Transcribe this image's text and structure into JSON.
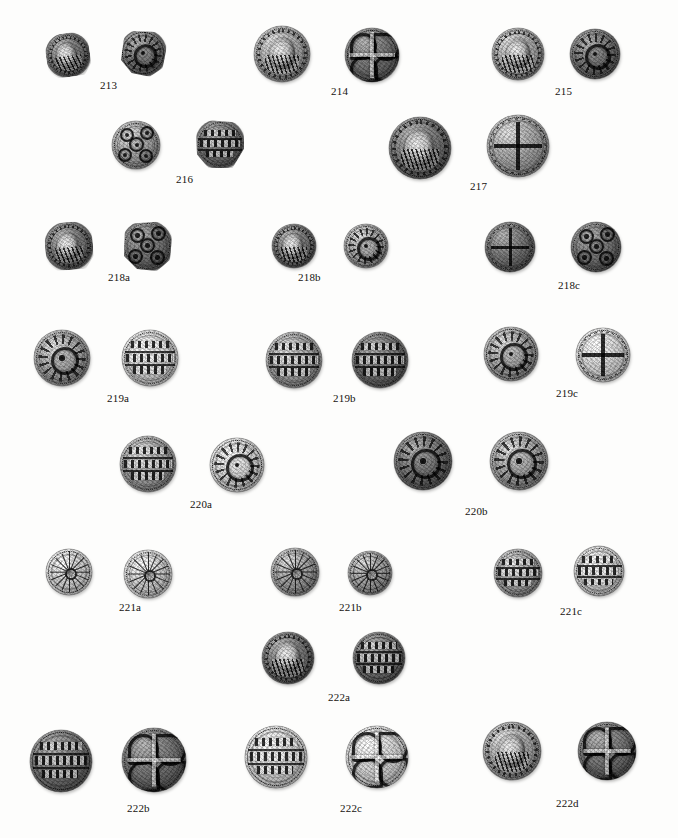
{
  "plate": {
    "background_color": "#fdfdfc",
    "caption_color": "#15130f",
    "description": "Photographic plate of Anglo-Saxon silver pennies shown as obverse and reverse pairs with catalogue numbers"
  },
  "entries": [
    {
      "id": "213",
      "label": "213",
      "label_x": 100,
      "label_y": 80,
      "coins": [
        {
          "x": 46,
          "y": 33,
          "size": 44,
          "design": "bust",
          "tone": "dark",
          "clip": "clip-a",
          "rotate": -8,
          "name": "coin-213-obverse"
        },
        {
          "x": 120,
          "y": 30,
          "size": 46,
          "design": "rosette",
          "tone": "dark",
          "clip": "clip-b",
          "rotate": 6,
          "name": "coin-213-reverse"
        }
      ]
    },
    {
      "id": "214",
      "label": "214",
      "label_x": 331,
      "label_y": 86,
      "coins": [
        {
          "x": 254,
          "y": 26,
          "size": 56,
          "design": "bust",
          "tone": "mid",
          "clip": "",
          "rotate": 0,
          "name": "coin-214-obverse"
        },
        {
          "x": 345,
          "y": 28,
          "size": 54,
          "design": "knot",
          "tone": "dark",
          "clip": "",
          "rotate": 0,
          "name": "coin-214-reverse"
        }
      ]
    },
    {
      "id": "215",
      "label": "215",
      "label_x": 555,
      "label_y": 86,
      "coins": [
        {
          "x": 492,
          "y": 28,
          "size": 52,
          "design": "bust",
          "tone": "mid",
          "clip": "",
          "rotate": 0,
          "name": "coin-215-obverse"
        },
        {
          "x": 570,
          "y": 29,
          "size": 50,
          "design": "rosette",
          "tone": "dark",
          "clip": "",
          "rotate": 0,
          "name": "coin-215-reverse"
        }
      ]
    },
    {
      "id": "216",
      "label": "216",
      "label_x": 176,
      "label_y": 174,
      "coins": [
        {
          "x": 112,
          "y": 121,
          "size": 48,
          "design": "annulets",
          "tone": "mid",
          "clip": "",
          "rotate": 0,
          "name": "coin-216-obverse"
        },
        {
          "x": 196,
          "y": 120,
          "size": 48,
          "design": "lines",
          "tone": "dark",
          "clip": "clip-c",
          "rotate": 0,
          "name": "coin-216-reverse"
        }
      ]
    },
    {
      "id": "217",
      "label": "217",
      "label_x": 470,
      "label_y": 181,
      "coins": [
        {
          "x": 389,
          "y": 117,
          "size": 62,
          "design": "bust",
          "tone": "dark",
          "clip": "",
          "rotate": 0,
          "name": "coin-217-obverse"
        },
        {
          "x": 487,
          "y": 115,
          "size": 62,
          "design": "cross",
          "tone": "mid",
          "clip": "",
          "rotate": 0,
          "name": "coin-217-reverse"
        }
      ]
    },
    {
      "id": "218a",
      "label": "218a",
      "label_x": 108,
      "label_y": 272,
      "coins": [
        {
          "x": 45,
          "y": 222,
          "size": 48,
          "design": "bust",
          "tone": "dark",
          "clip": "clip-a",
          "rotate": -4,
          "name": "coin-218a-obverse"
        },
        {
          "x": 122,
          "y": 221,
          "size": 50,
          "design": "annulets",
          "tone": "dark",
          "clip": "clip-b",
          "rotate": 0,
          "name": "coin-218a-reverse"
        }
      ]
    },
    {
      "id": "218b",
      "label": "218b",
      "label_x": 298,
      "label_y": 272,
      "coins": [
        {
          "x": 272,
          "y": 224,
          "size": 44,
          "design": "bust",
          "tone": "dark",
          "clip": "",
          "rotate": 0,
          "name": "coin-218b-obverse"
        },
        {
          "x": 344,
          "y": 224,
          "size": 44,
          "design": "rosette",
          "tone": "mid",
          "clip": "",
          "rotate": 0,
          "name": "coin-218b-reverse"
        }
      ]
    },
    {
      "id": "218c",
      "label": "218c",
      "label_x": 558,
      "label_y": 280,
      "coins": [
        {
          "x": 485,
          "y": 222,
          "size": 50,
          "design": "cross",
          "tone": "dark",
          "clip": "",
          "rotate": 0,
          "name": "coin-218c-obverse"
        },
        {
          "x": 571,
          "y": 222,
          "size": 50,
          "design": "annulets",
          "tone": "dark",
          "clip": "",
          "rotate": 0,
          "name": "coin-218c-reverse"
        }
      ]
    },
    {
      "id": "219a",
      "label": "219a",
      "label_x": 107,
      "label_y": 393,
      "coins": [
        {
          "x": 34,
          "y": 330,
          "size": 56,
          "design": "rosette",
          "tone": "mid",
          "clip": "",
          "rotate": 0,
          "name": "coin-219a-obverse"
        },
        {
          "x": 122,
          "y": 330,
          "size": 56,
          "design": "lines",
          "tone": "pale",
          "clip": "",
          "rotate": 0,
          "name": "coin-219a-reverse"
        }
      ]
    },
    {
      "id": "219b",
      "label": "219b",
      "label_x": 333,
      "label_y": 393,
      "coins": [
        {
          "x": 266,
          "y": 332,
          "size": 56,
          "design": "lines",
          "tone": "mid",
          "clip": "",
          "rotate": 0,
          "name": "coin-219b-obverse"
        },
        {
          "x": 352,
          "y": 332,
          "size": 56,
          "design": "lines",
          "tone": "dark",
          "clip": "",
          "rotate": 0,
          "name": "coin-219b-reverse"
        }
      ]
    },
    {
      "id": "219c",
      "label": "219c",
      "label_x": 556,
      "label_y": 388,
      "coins": [
        {
          "x": 484,
          "y": 327,
          "size": 54,
          "design": "rosette",
          "tone": "mid",
          "clip": "",
          "rotate": 0,
          "name": "coin-219c-obverse"
        },
        {
          "x": 576,
          "y": 328,
          "size": 54,
          "design": "cross",
          "tone": "pale",
          "clip": "",
          "rotate": 0,
          "name": "coin-219c-reverse"
        }
      ]
    },
    {
      "id": "220a",
      "label": "220a",
      "label_x": 190,
      "label_y": 499,
      "coins": [
        {
          "x": 120,
          "y": 436,
          "size": 56,
          "design": "lines",
          "tone": "mid",
          "clip": "",
          "rotate": 0,
          "name": "coin-220a-obverse"
        },
        {
          "x": 210,
          "y": 438,
          "size": 54,
          "design": "rosette",
          "tone": "pale",
          "clip": "",
          "rotate": 0,
          "name": "coin-220a-reverse"
        }
      ]
    },
    {
      "id": "220b",
      "label": "220b",
      "label_x": 465,
      "label_y": 506,
      "coins": [
        {
          "x": 394,
          "y": 432,
          "size": 58,
          "design": "rosette",
          "tone": "dark",
          "clip": "",
          "rotate": 0,
          "name": "coin-220b-obverse"
        },
        {
          "x": 490,
          "y": 432,
          "size": 58,
          "design": "rosette",
          "tone": "mid",
          "clip": "",
          "rotate": 0,
          "name": "coin-220b-reverse"
        }
      ]
    },
    {
      "id": "221a",
      "label": "221a",
      "label_x": 119,
      "label_y": 602,
      "coins": [
        {
          "x": 46,
          "y": 549,
          "size": 46,
          "design": "star",
          "tone": "pale",
          "clip": "",
          "rotate": 0,
          "name": "coin-221a-obverse"
        },
        {
          "x": 124,
          "y": 550,
          "size": 48,
          "design": "star",
          "tone": "pale",
          "clip": "",
          "rotate": 0,
          "name": "coin-221a-reverse"
        }
      ]
    },
    {
      "id": "221b",
      "label": "221b",
      "label_x": 339,
      "label_y": 602,
      "coins": [
        {
          "x": 271,
          "y": 548,
          "size": 48,
          "design": "star",
          "tone": "mid",
          "clip": "",
          "rotate": 0,
          "name": "coin-221b-obverse"
        },
        {
          "x": 348,
          "y": 551,
          "size": 44,
          "design": "star",
          "tone": "mid",
          "clip": "",
          "rotate": 0,
          "name": "coin-221b-reverse"
        }
      ]
    },
    {
      "id": "221c",
      "label": "221c",
      "label_x": 560,
      "label_y": 606,
      "coins": [
        {
          "x": 494,
          "y": 549,
          "size": 48,
          "design": "lines",
          "tone": "mid",
          "clip": "",
          "rotate": 0,
          "name": "coin-221c-obverse"
        },
        {
          "x": 574,
          "y": 546,
          "size": 50,
          "design": "lines",
          "tone": "pale",
          "clip": "",
          "rotate": 0,
          "name": "coin-221c-reverse"
        }
      ]
    },
    {
      "id": "222a",
      "label": "222a",
      "label_x": 328,
      "label_y": 692,
      "coins": [
        {
          "x": 262,
          "y": 632,
          "size": 52,
          "design": "bust",
          "tone": "dark",
          "clip": "",
          "rotate": 0,
          "name": "coin-222a-obverse"
        },
        {
          "x": 353,
          "y": 632,
          "size": 52,
          "design": "lines",
          "tone": "dark",
          "clip": "",
          "rotate": 0,
          "name": "coin-222a-reverse"
        }
      ]
    },
    {
      "id": "222b",
      "label": "222b",
      "label_x": 127,
      "label_y": 803,
      "coins": [
        {
          "x": 30,
          "y": 730,
          "size": 62,
          "design": "lines",
          "tone": "dark",
          "clip": "",
          "rotate": 0,
          "name": "coin-222b-obverse"
        },
        {
          "x": 122,
          "y": 728,
          "size": 64,
          "design": "knot",
          "tone": "dark",
          "clip": "",
          "rotate": 0,
          "name": "coin-222b-reverse"
        }
      ]
    },
    {
      "id": "222c",
      "label": "222c",
      "label_x": 340,
      "label_y": 803,
      "coins": [
        {
          "x": 245,
          "y": 726,
          "size": 62,
          "design": "lines",
          "tone": "pale",
          "clip": "",
          "rotate": 0,
          "name": "coin-222c-obverse"
        },
        {
          "x": 346,
          "y": 726,
          "size": 62,
          "design": "knot",
          "tone": "pale",
          "clip": "",
          "rotate": 0,
          "name": "coin-222c-reverse"
        }
      ]
    },
    {
      "id": "222d",
      "label": "222d",
      "label_x": 556,
      "label_y": 798,
      "coins": [
        {
          "x": 483,
          "y": 722,
          "size": 58,
          "design": "bust",
          "tone": "mid",
          "clip": "",
          "rotate": 0,
          "name": "coin-222d-obverse"
        },
        {
          "x": 578,
          "y": 722,
          "size": 58,
          "design": "knot",
          "tone": "dark",
          "clip": "",
          "rotate": 0,
          "name": "coin-222d-reverse"
        }
      ]
    }
  ]
}
